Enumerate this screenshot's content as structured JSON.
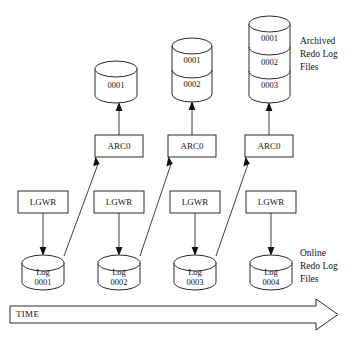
{
  "diagram": {
    "background_color": "#ffffff",
    "line_color": "#2a2a2a",
    "text_color": "#141414",
    "archived_group_label": {
      "line1": "Archived",
      "line2": "Redo Log",
      "line3": "Files"
    },
    "online_group_label": {
      "line1": "Online",
      "line2": "Redo Log",
      "line3": "Files"
    },
    "time_axis": {
      "label": "TIME",
      "direction": "left-to-right"
    },
    "archived_stacks": [
      {
        "name": "archived-stack-1",
        "segments": [
          "0001"
        ]
      },
      {
        "name": "archived-stack-2",
        "segments": [
          "0001",
          "0002"
        ]
      },
      {
        "name": "archived-stack-3",
        "segments": [
          "0001",
          "0002",
          "0003"
        ]
      }
    ],
    "arc_processes": [
      {
        "label": "ARC0"
      },
      {
        "label": "ARC0"
      },
      {
        "label": "ARC0"
      }
    ],
    "lgwr_processes": [
      {
        "label": "LGWR"
      },
      {
        "label": "LGWR"
      },
      {
        "label": "LGWR"
      },
      {
        "label": "LGWR"
      }
    ],
    "online_logs": [
      {
        "line1": "Log",
        "line2": "0001"
      },
      {
        "line1": "Log",
        "line2": "0002"
      },
      {
        "line1": "Log",
        "line2": "0003"
      },
      {
        "line1": "Log",
        "line2": "0004"
      }
    ]
  }
}
